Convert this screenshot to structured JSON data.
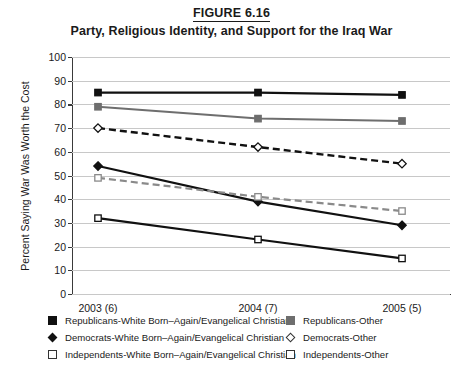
{
  "figure": {
    "label": "FIGURE 6.16",
    "title": "Party, Religious Identity, and Support for the Iraq War"
  },
  "chart_data": {
    "type": "line",
    "title": "Party, Religious Identity, and Support for the Iraq War",
    "figure_label": "FIGURE 6.16",
    "xlabel": "",
    "ylabel": "Percent Saying War Was Worth the Cost",
    "categories": [
      "2003 (6)",
      "2004 (7)",
      "2005 (5)"
    ],
    "ylim": [
      0,
      100
    ],
    "ytick_step": 10,
    "yticks": [
      0,
      10,
      20,
      30,
      40,
      50,
      60,
      70,
      80,
      90,
      100
    ],
    "grid": true,
    "legend_position": "bottom",
    "series": [
      {
        "name": "Republicans-White Born-Again/Evangelical Christian",
        "values": [
          85,
          85,
          84
        ],
        "marker": "filled-square",
        "color": "#111111",
        "line": "solid",
        "width": 2.2
      },
      {
        "name": "Republicans-Other",
        "values": [
          79,
          74,
          73
        ],
        "marker": "filled-square",
        "color": "#6e6e6e",
        "line": "solid",
        "width": 2.0
      },
      {
        "name": "Democrats-White Born-Again/Evangelical Christian",
        "values": [
          54,
          39,
          29
        ],
        "marker": "filled-diamond",
        "color": "#111111",
        "line": "solid",
        "width": 2.2
      },
      {
        "name": "Democrats-Other",
        "values": [
          70,
          62,
          55
        ],
        "marker": "open-diamond",
        "color": "#111111",
        "line": "dashed",
        "width": 2.4
      },
      {
        "name": "Independents-White Born-Again/Evangelical Christian",
        "values": [
          32,
          23,
          15
        ],
        "marker": "open-square",
        "color": "#111111",
        "line": "solid",
        "width": 2.2
      },
      {
        "name": "Independents-Other",
        "values": [
          49,
          41,
          35
        ],
        "marker": "open-square",
        "color": "#8a8a8a",
        "line": "dashed",
        "width": 2.2
      }
    ]
  },
  "legend": {
    "left_column": [
      {
        "label": "Republicans-White Born–Again/Evangelical Christian",
        "marker": "filled-square"
      },
      {
        "label": "Democrats-White Born–Again/Evangelical Christian",
        "marker": "filled-diamond"
      },
      {
        "label": "Independents-White Born–Again/Evangelical Christian",
        "marker": "open-square"
      }
    ],
    "right_column": [
      {
        "label": "Republicans-Other",
        "marker": "gray-square"
      },
      {
        "label": "Democrats-Other",
        "marker": "open-diamond"
      },
      {
        "label": "Independents-Other",
        "marker": "open-square"
      }
    ]
  }
}
